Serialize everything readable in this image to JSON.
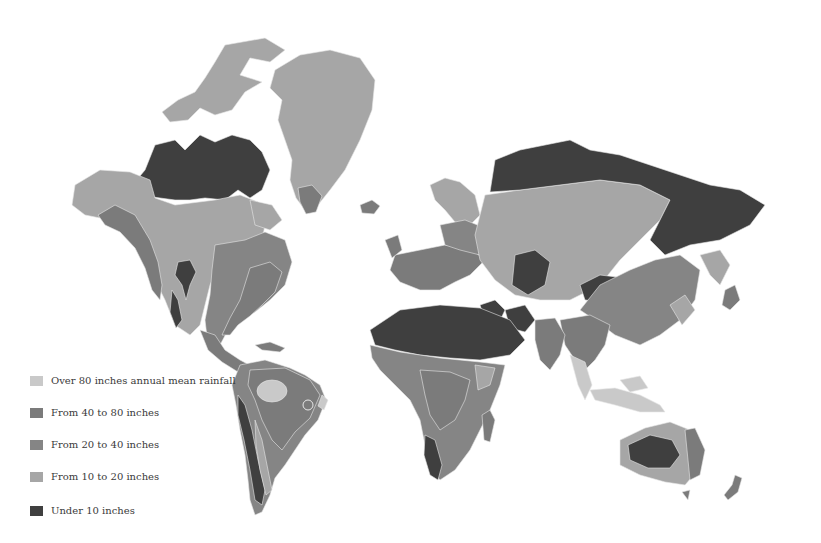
{
  "map": {
    "subject": "World annual mean rainfall",
    "style": "grayscale choropleth"
  },
  "legend": {
    "items": [
      {
        "label": "Over 80 inches annual mean rainfall",
        "key": "over80",
        "color": "#c9c9c9"
      },
      {
        "label": "From 40 to 80 inches",
        "key": "40to80",
        "color": "#7b7b7b"
      },
      {
        "label": "From 20 to 40 inches",
        "key": "20to40",
        "color": "#858585"
      },
      {
        "label": "From 10 to 20 inches",
        "key": "10to20",
        "color": "#a6a6a6"
      },
      {
        "label": "Under 10 inches",
        "key": "under10",
        "color": "#3f3f3f"
      }
    ]
  },
  "zone_colors": {
    "over80": "#c9c9c9",
    "40to80": "#7b7b7b",
    "20to40": "#858585",
    "10to20": "#a6a6a6",
    "under10": "#3f3f3f",
    "coast_line": "#e8e8e8"
  }
}
